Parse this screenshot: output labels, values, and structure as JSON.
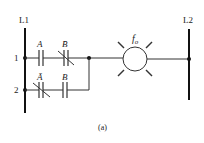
{
  "rails": {
    "left_label": "L1",
    "right_label": "L2"
  },
  "rungs": [
    {
      "number": "1",
      "contacts": [
        {
          "label": "A",
          "type": "normally-open"
        },
        {
          "label": "B̄",
          "type": "normally-closed"
        }
      ]
    },
    {
      "number": "2",
      "contacts": [
        {
          "label": "Ā",
          "type": "normally-closed"
        },
        {
          "label": "B",
          "type": "normally-open"
        }
      ]
    }
  ],
  "output": {
    "label": "f",
    "subscript": "o",
    "type": "lamp"
  },
  "caption": "(a)"
}
